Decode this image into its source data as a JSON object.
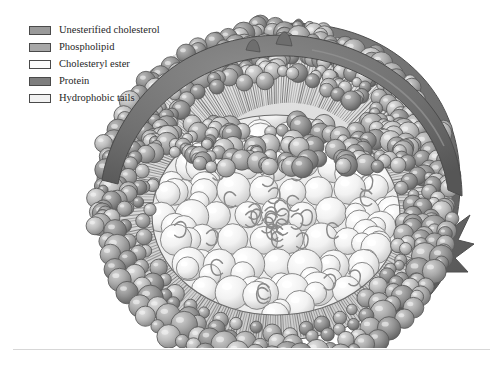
{
  "figure": {
    "background_color": "#ffffff"
  },
  "legend": {
    "items": [
      {
        "label": "Unesterified cholesterol",
        "swatch_fill": "#9a9a9a",
        "swatch_stroke": "#4a4a4a",
        "icon": "color-swatch-icon"
      },
      {
        "label": "Phospholipid",
        "swatch_fill": "#a8a8a8",
        "swatch_stroke": "#4a4a4a",
        "icon": "color-swatch-icon"
      },
      {
        "label": "Cholesteryl ester",
        "swatch_fill": "#fbfbfb",
        "swatch_stroke": "#4a4a4a",
        "icon": "color-swatch-icon"
      },
      {
        "label": "Protein",
        "swatch_fill": "#7e7e7e",
        "swatch_stroke": "#4a4a4a",
        "icon": "color-swatch-icon"
      },
      {
        "label": "Hydrophobic tails",
        "swatch_fill": "#f2f2f2",
        "swatch_stroke": "#4a4a4a",
        "icon": "color-swatch-icon"
      }
    ]
  },
  "illustration": {
    "protein_band_color": "#6f6f6f",
    "protein_band_shadow": "#5c5c5c",
    "phospholipid_head_color": "#b2b2b2",
    "phospholipid_head_dark": "#949494",
    "cholesterol_head_color": "#9a9a9a",
    "tail_region_color": "#dcdcdc",
    "tail_line_color": "#6e6e6e",
    "core_sphere_color": "#f4f4f4",
    "core_sphere_highlight": "#ffffff",
    "core_tail_color": "#8a8a8a",
    "outline_color": "#3f3f3f"
  },
  "divider": {
    "color": "#d7d7d7"
  }
}
